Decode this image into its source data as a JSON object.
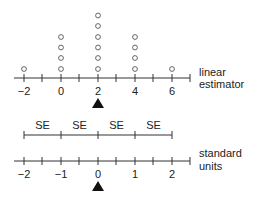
{
  "top_axis": {
    "label_line1": "linear",
    "label_line2": "estimator",
    "tick_labels": [
      "−2",
      "0",
      "2",
      "4",
      "6"
    ],
    "tick_values": [
      -2,
      0,
      2,
      4,
      6
    ],
    "pointer_at": 2
  },
  "dotplot": {
    "counts": [
      {
        "x": -2,
        "n": 1
      },
      {
        "x": 0,
        "n": 4
      },
      {
        "x": 2,
        "n": 6
      },
      {
        "x": 4,
        "n": 4
      },
      {
        "x": 6,
        "n": 1
      }
    ]
  },
  "se_bar": {
    "labels": [
      "SE",
      "SE",
      "SE",
      "SE"
    ]
  },
  "bottom_axis": {
    "label_line1": "standard",
    "label_line2": "units",
    "tick_labels": [
      "−2",
      "−1",
      "0",
      "1",
      "2"
    ],
    "tick_values": [
      -2,
      -1,
      0,
      1,
      2
    ],
    "pointer_at": 0
  }
}
